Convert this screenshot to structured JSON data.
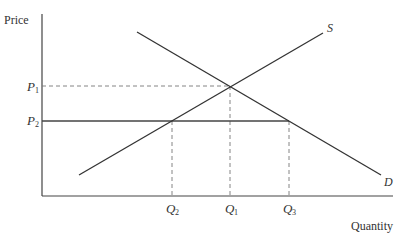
{
  "diagram": {
    "type": "supply-demand-price-floor",
    "axes": {
      "y_label": "Price",
      "x_label": "Quantity"
    },
    "curves": {
      "supply_label": "S",
      "demand_label": "D"
    },
    "price_levels": [
      {
        "label": "P",
        "sub": "1",
        "style": "dashed"
      },
      {
        "label": "P",
        "sub": "2",
        "style": "solid"
      }
    ],
    "quantity_levels": [
      {
        "label": "Q",
        "sub": "2"
      },
      {
        "label": "Q",
        "sub": "1"
      },
      {
        "label": "Q",
        "sub": "3"
      }
    ],
    "colors": {
      "line": "#333333",
      "dashed": "#777777",
      "text": "#333333"
    }
  }
}
